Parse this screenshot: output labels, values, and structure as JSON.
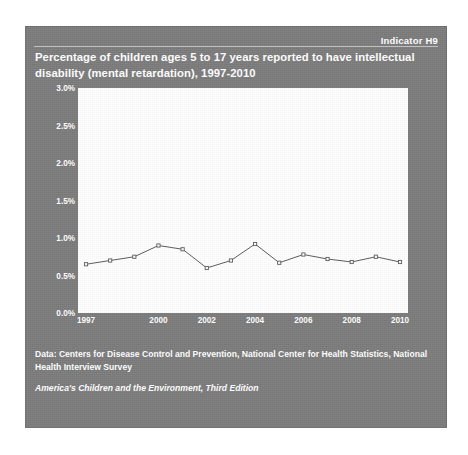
{
  "panel": {
    "indicator_label": "Indicator H9",
    "title": "Percentage of children ages 5 to 17 years reported to have intellectual disability (mental retardation), 1997-2010",
    "background_color": "#7b7b7b",
    "text_color": "#ffffff"
  },
  "footer": {
    "data_note": "Data: Centers for Disease Control and Prevention, National Center for Health Statistics, National Health Interview Survey",
    "source": "America's Children and the Environment, Third Edition"
  },
  "chart_data": {
    "type": "line",
    "title": "Percentage of children ages 5 to 17 years reported to have intellectual disability (mental retardation), 1997-2010",
    "xlabel": "",
    "ylabel": "",
    "x": [
      1997,
      1998,
      1999,
      2000,
      2001,
      2002,
      2003,
      2004,
      2005,
      2006,
      2007,
      2008,
      2009,
      2010
    ],
    "values": [
      0.65,
      0.7,
      0.75,
      0.9,
      0.85,
      0.6,
      0.7,
      0.92,
      0.67,
      0.78,
      0.72,
      0.68,
      0.75,
      0.68
    ],
    "series": [
      {
        "name": "Intellectual disability",
        "values": [
          0.65,
          0.7,
          0.75,
          0.9,
          0.85,
          0.6,
          0.7,
          0.92,
          0.67,
          0.78,
          0.72,
          0.68,
          0.75,
          0.68
        ]
      }
    ],
    "ylim": [
      0.0,
      3.0
    ],
    "xlim": [
      1997,
      2010
    ],
    "ytick_labels": [
      "0.0%",
      "0.5%",
      "1.0%",
      "1.5%",
      "2.0%",
      "2.5%",
      "3.0%"
    ],
    "ytick_values": [
      0.0,
      0.5,
      1.0,
      1.5,
      2.0,
      2.5,
      3.0
    ],
    "xtick_labels": [
      "1997",
      "2000",
      "2002",
      "2004",
      "2006",
      "2008",
      "2010"
    ],
    "xtick_values": [
      1997,
      2000,
      2002,
      2004,
      2006,
      2008,
      2010
    ],
    "grid": false,
    "legend": "none",
    "line_color": "#5a5a5a",
    "marker": "square",
    "plot_background": "#ffffff"
  }
}
